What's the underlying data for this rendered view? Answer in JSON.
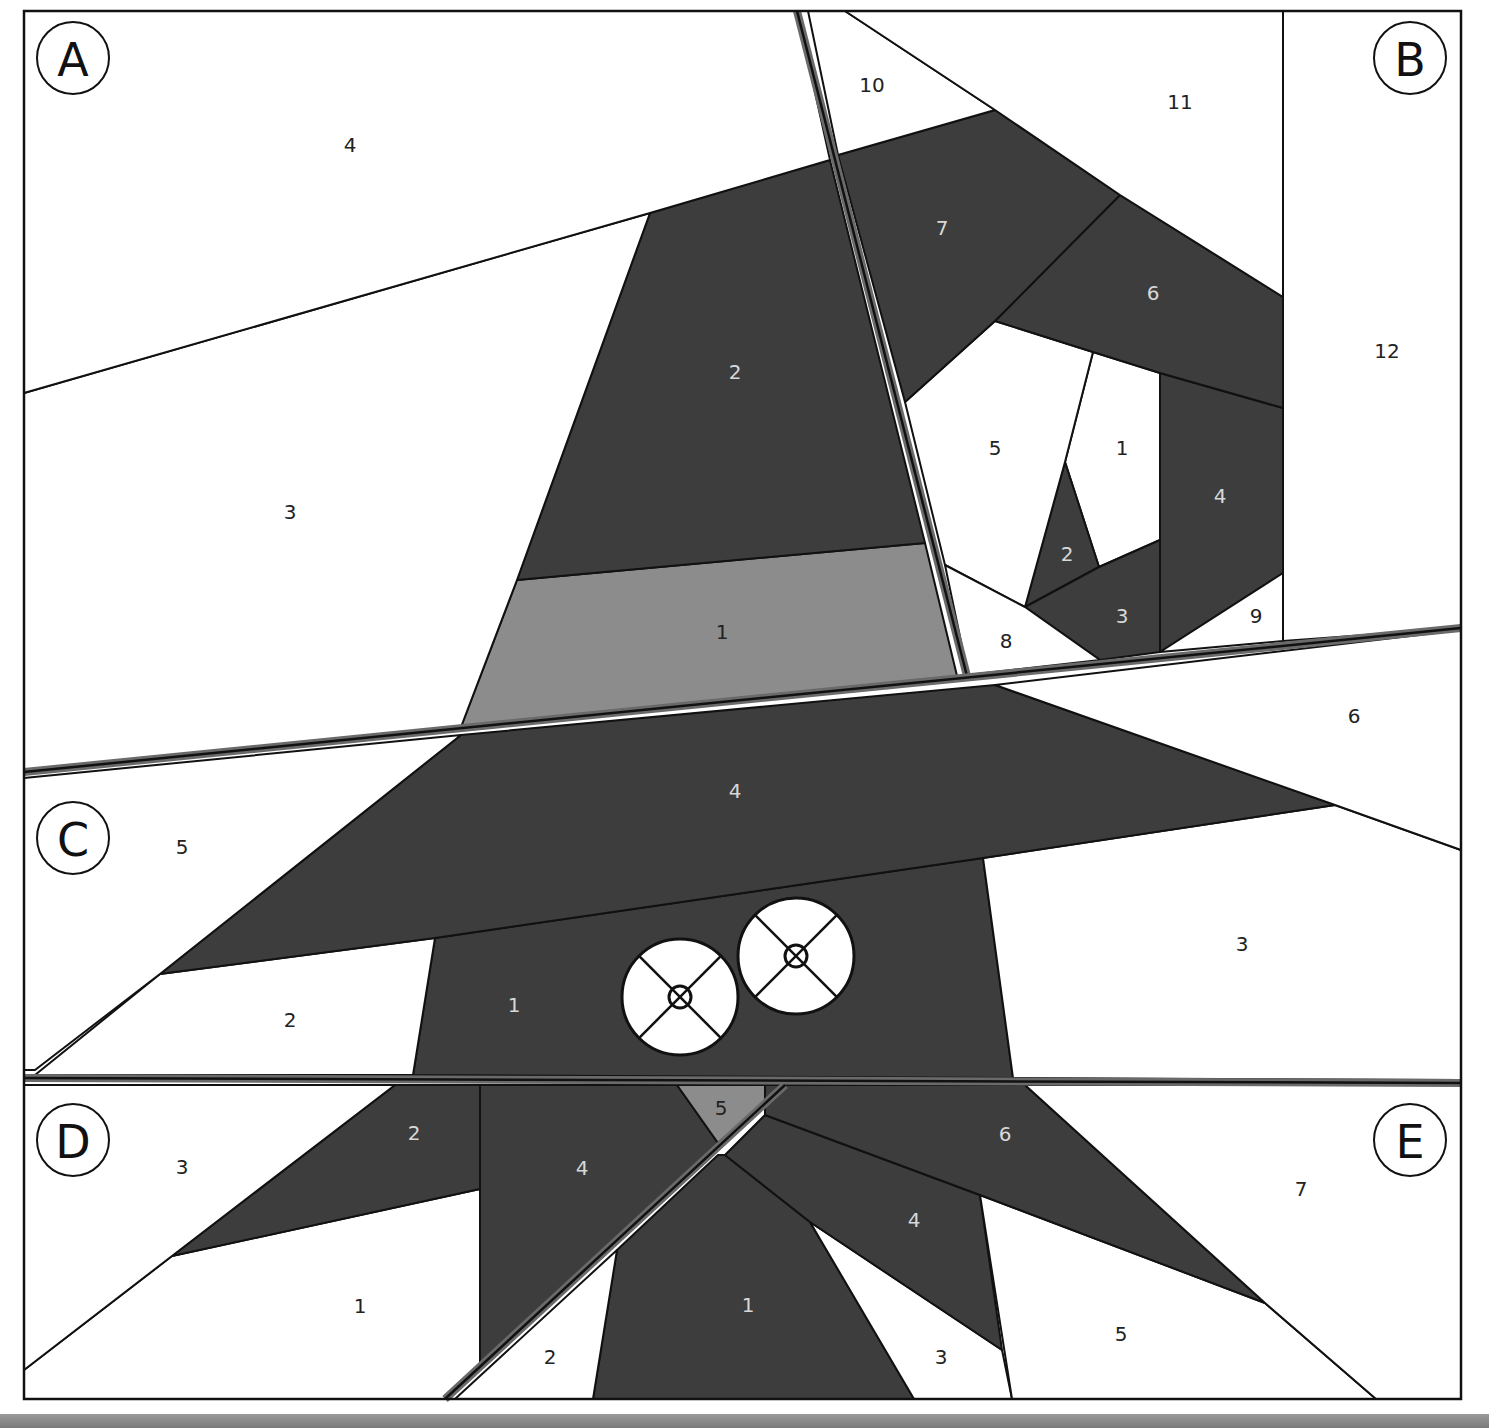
{
  "colors": {
    "dark": "#3d3d3d",
    "medium": "#8c8c8c",
    "white": "#ffffff",
    "line": "#111111",
    "seam": "#6a6a6a",
    "label_on_dark": "#d8d8d8",
    "label_on_light": "#222222"
  },
  "sections": [
    {
      "letter": "A",
      "pieces": [
        {
          "id": "A1",
          "label": "1",
          "fill": "medium"
        },
        {
          "id": "A2",
          "label": "2",
          "fill": "dark"
        },
        {
          "id": "A3",
          "label": "3",
          "fill": "white"
        },
        {
          "id": "A4",
          "label": "4",
          "fill": "white"
        }
      ]
    },
    {
      "letter": "B",
      "pieces": [
        {
          "id": "B1",
          "label": "1",
          "fill": "white"
        },
        {
          "id": "B2",
          "label": "2",
          "fill": "dark"
        },
        {
          "id": "B3",
          "label": "3",
          "fill": "dark"
        },
        {
          "id": "B4",
          "label": "4",
          "fill": "dark"
        },
        {
          "id": "B5",
          "label": "5",
          "fill": "white"
        },
        {
          "id": "B6",
          "label": "6",
          "fill": "dark"
        },
        {
          "id": "B7",
          "label": "7",
          "fill": "dark"
        },
        {
          "id": "B8",
          "label": "8",
          "fill": "white"
        },
        {
          "id": "B9",
          "label": "9",
          "fill": "white"
        },
        {
          "id": "B10",
          "label": "10",
          "fill": "white"
        },
        {
          "id": "B11",
          "label": "11",
          "fill": "white"
        },
        {
          "id": "B12",
          "label": "12",
          "fill": "white"
        }
      ]
    },
    {
      "letter": "C",
      "pieces": [
        {
          "id": "C1",
          "label": "1",
          "fill": "dark"
        },
        {
          "id": "C2",
          "label": "2",
          "fill": "white"
        },
        {
          "id": "C3",
          "label": "3",
          "fill": "white"
        },
        {
          "id": "C4",
          "label": "4",
          "fill": "dark"
        },
        {
          "id": "C5",
          "label": "5",
          "fill": "white"
        },
        {
          "id": "C6",
          "label": "6",
          "fill": "white"
        }
      ]
    },
    {
      "letter": "D",
      "pieces": [
        {
          "id": "D1",
          "label": "1",
          "fill": "white"
        },
        {
          "id": "D2",
          "label": "2",
          "fill": "dark"
        },
        {
          "id": "D3",
          "label": "3",
          "fill": "white"
        },
        {
          "id": "D4",
          "label": "4",
          "fill": "dark"
        },
        {
          "id": "D5",
          "label": "5",
          "fill": "medium"
        }
      ]
    },
    {
      "letter": "E",
      "pieces": [
        {
          "id": "E1",
          "label": "1",
          "fill": "dark"
        },
        {
          "id": "E2",
          "label": "2",
          "fill": "white"
        },
        {
          "id": "E3",
          "label": "3",
          "fill": "white"
        },
        {
          "id": "E4",
          "label": "4",
          "fill": "dark"
        },
        {
          "id": "E5",
          "label": "5",
          "fill": "white"
        },
        {
          "id": "E6",
          "label": "6",
          "fill": "dark"
        },
        {
          "id": "E7",
          "label": "7",
          "fill": "white"
        }
      ]
    }
  ],
  "eyes": [
    {
      "name": "left-eye",
      "fill": "white"
    },
    {
      "name": "right-eye",
      "fill": "white"
    }
  ]
}
